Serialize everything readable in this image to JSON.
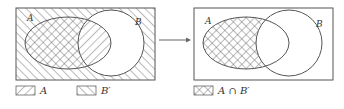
{
  "diagram": {
    "type": "venn-set-operation",
    "left_panel": {
      "set_a_label": "A",
      "set_b_label": "B",
      "legend": [
        {
          "swatch": "forward-hatch",
          "label": "A"
        },
        {
          "swatch": "back-hatch",
          "label": "B′"
        }
      ]
    },
    "arrow": "right-arrow",
    "right_panel": {
      "set_a_label": "A",
      "set_b_label": "B",
      "legend": [
        {
          "swatch": "cross-hatch",
          "label": "A ∩ B′"
        }
      ]
    },
    "colors": {
      "stroke": "#555555",
      "hatch": "#666666",
      "background": "#ffffff"
    }
  }
}
